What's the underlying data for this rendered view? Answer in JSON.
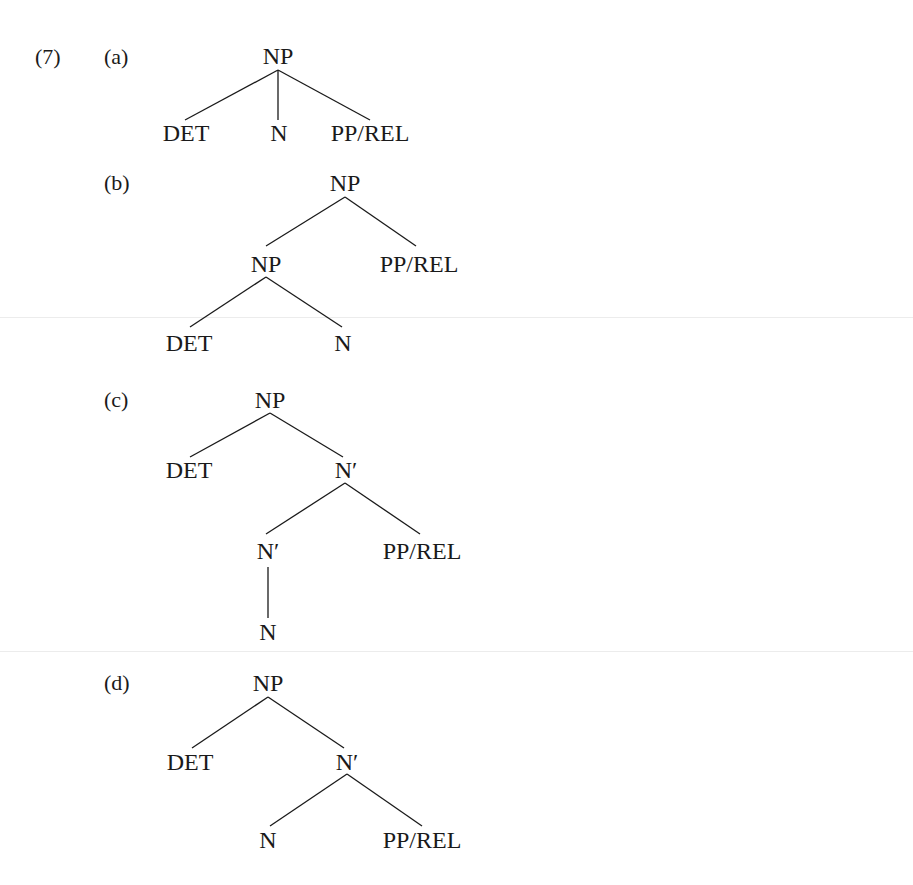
{
  "example_number": "(7)",
  "trees": [
    {
      "label": "(a)",
      "nodes": [
        {
          "id": "np",
          "text": "NP",
          "x": 278,
          "y": 56
        },
        {
          "id": "det",
          "text": "DET",
          "x": 186,
          "y": 133
        },
        {
          "id": "n",
          "text": "N",
          "x": 279,
          "y": 133
        },
        {
          "id": "pp",
          "text": "PP/REL",
          "x": 370,
          "y": 133
        }
      ],
      "edges": [
        [
          278,
          70,
          185,
          120
        ],
        [
          278,
          70,
          278,
          120
        ],
        [
          278,
          70,
          370,
          120
        ]
      ]
    },
    {
      "label": "(b)",
      "nodes": [
        {
          "id": "np",
          "text": "NP",
          "x": 345,
          "y": 183
        },
        {
          "id": "np2",
          "text": "NP",
          "x": 266,
          "y": 264
        },
        {
          "id": "pp",
          "text": "PP/REL",
          "x": 419,
          "y": 264
        },
        {
          "id": "det",
          "text": "DET",
          "x": 189,
          "y": 343
        },
        {
          "id": "n",
          "text": "N",
          "x": 343,
          "y": 343
        }
      ],
      "edges": [
        [
          345,
          197,
          266,
          246
        ],
        [
          345,
          197,
          416,
          246
        ],
        [
          266,
          277,
          190,
          327
        ],
        [
          266,
          277,
          342,
          327
        ]
      ]
    },
    {
      "label": "(c)",
      "nodes": [
        {
          "id": "np",
          "text": "NP",
          "x": 270,
          "y": 400
        },
        {
          "id": "det",
          "text": "DET",
          "x": 189,
          "y": 470
        },
        {
          "id": "n1",
          "text": "N′",
          "x": 346,
          "y": 470
        },
        {
          "id": "n2",
          "text": "N′",
          "x": 268,
          "y": 551
        },
        {
          "id": "pp",
          "text": "PP/REL",
          "x": 422,
          "y": 551
        },
        {
          "id": "n",
          "text": "N",
          "x": 268,
          "y": 632
        }
      ],
      "edges": [
        [
          270,
          413,
          190,
          457
        ],
        [
          270,
          413,
          343,
          457
        ],
        [
          345,
          483,
          266,
          534
        ],
        [
          345,
          483,
          420,
          534
        ],
        [
          268,
          567,
          268,
          618
        ]
      ]
    },
    {
      "label": "(d)",
      "nodes": [
        {
          "id": "np",
          "text": "NP",
          "x": 268,
          "y": 683
        },
        {
          "id": "det",
          "text": "DET",
          "x": 190,
          "y": 762
        },
        {
          "id": "n1",
          "text": "N′",
          "x": 347,
          "y": 762
        },
        {
          "id": "n",
          "text": "N",
          "x": 268,
          "y": 840
        },
        {
          "id": "pp",
          "text": "PP/REL",
          "x": 422,
          "y": 840
        }
      ],
      "edges": [
        [
          268,
          697,
          192,
          748
        ],
        [
          268,
          697,
          344,
          748
        ],
        [
          347,
          774,
          270,
          826
        ],
        [
          347,
          774,
          422,
          826
        ]
      ]
    }
  ],
  "label_positions": [
    {
      "x": 104,
      "y": 46
    },
    {
      "x": 104,
      "y": 172
    },
    {
      "x": 104,
      "y": 389
    },
    {
      "x": 104,
      "y": 672
    }
  ]
}
